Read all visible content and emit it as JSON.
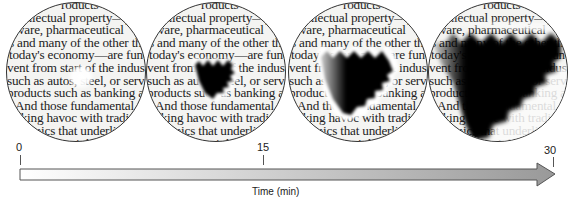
{
  "figure": {
    "type": "time-progression diagram"
  },
  "text_lines": [
    "roducts whi",
    "ellectual property—p",
    "ware,  pharmaceutical",
    "s and many of the other th",
    "today's economy—are funda",
    "vent from start of the industr",
    "such as autos, steel, or servi",
    "products such as banking ar",
    "And those fundamental di",
    "aking havoc with tradition",
    "mics that underlie an",
    "copyright laws"
  ],
  "panels": [
    {
      "label": "panel-1",
      "stage": "t≈0",
      "scotoma": "small bright spot"
    },
    {
      "label": "panel-2",
      "stage": "early",
      "scotoma": "small zigzag dark region"
    },
    {
      "label": "panel-3",
      "stage": "t≈15",
      "scotoma": "larger zigzag dark region"
    },
    {
      "label": "panel-4",
      "stage": "t≈30",
      "scotoma": "large zigzag dark region"
    }
  ],
  "timeline": {
    "ticks": [
      {
        "label": "0",
        "x": 19
      },
      {
        "label": "15",
        "x": 263
      },
      {
        "label": "30",
        "x": 553
      }
    ],
    "axis_label": "Time (min)",
    "arrow_color_start": "#ffffff",
    "arrow_color_end": "#999999"
  }
}
